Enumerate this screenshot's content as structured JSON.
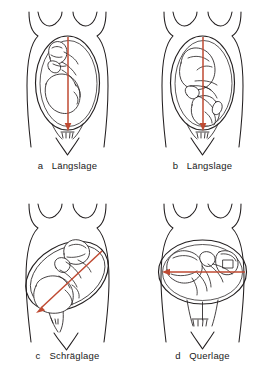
{
  "figure": {
    "language": "de",
    "panel_count": 4,
    "line_color": "#231f20",
    "axis_color": "#bf4a32",
    "background": "#ffffff"
  },
  "panels": [
    {
      "letter": "a",
      "name": "Längslage",
      "axis": "vertical",
      "axis_direction": "down",
      "presentation": "breech",
      "description": "Längslage mit Steissläge"
    },
    {
      "letter": "b",
      "name": "Längslage",
      "axis": "vertical",
      "axis_direction": "down",
      "presentation": "cephalic",
      "description": "Längslage mit Schädellage"
    },
    {
      "letter": "c",
      "name": "Schräglage",
      "axis": "oblique",
      "axis_direction": "down-left",
      "presentation": "oblique",
      "description": "Schräglage"
    },
    {
      "letter": "d",
      "name": "Querlage",
      "axis": "horizontal",
      "axis_direction": "left",
      "presentation": "transverse",
      "description": "Querlage"
    }
  ]
}
